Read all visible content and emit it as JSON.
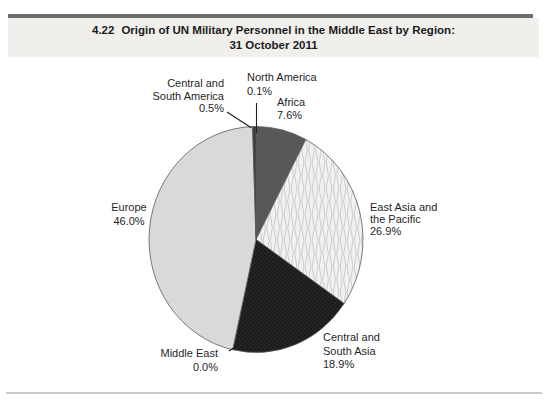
{
  "header": {
    "figure_number": "4.22",
    "title_line1": "Origin of UN Military Personnel in the Middle East by Region:",
    "title_line2": "31 October 2011"
  },
  "chart_data": {
    "type": "pie",
    "unit": "%",
    "direction": "clockwise",
    "start_angle_deg": 0,
    "outline_color": "#5a5a5c",
    "slices": [
      {
        "id": "north-america",
        "label": "North America",
        "label_lines": [
          "North America"
        ],
        "pct_label": "0.1%",
        "value": 0.1,
        "color": "#ffffff"
      },
      {
        "id": "africa",
        "label": "Africa",
        "label_lines": [
          "Africa"
        ],
        "pct_label": "7.6%",
        "value": 7.6,
        "color": "#58585a"
      },
      {
        "id": "east-asia-pacific",
        "label": "East Asia and the Pacific",
        "label_lines": [
          "East Asia and",
          "the Pacific"
        ],
        "pct_label": "26.9%",
        "value": 26.9,
        "color": "#ededed",
        "texture": "waves"
      },
      {
        "id": "central-south-asia",
        "label": "Central and South Asia",
        "label_lines": [
          "Central and",
          "South Asia"
        ],
        "pct_label": "18.9%",
        "value": 18.9,
        "color": "#1c1c1c",
        "texture": "dots"
      },
      {
        "id": "middle-east",
        "label": "Middle East",
        "label_lines": [
          "Middle East"
        ],
        "pct_label": "0.0%",
        "value": 0.0,
        "color": "#ffffff"
      },
      {
        "id": "europe",
        "label": "Europe",
        "label_lines": [
          "Europe"
        ],
        "pct_label": "46.0%",
        "value": 46.0,
        "color": "#d9d9d9"
      },
      {
        "id": "central-south-america",
        "label": "Central and South America",
        "label_lines": [
          "Central and",
          "South America"
        ],
        "pct_label": "0.5%",
        "value": 0.5,
        "color": "#3a3a3a"
      }
    ]
  }
}
